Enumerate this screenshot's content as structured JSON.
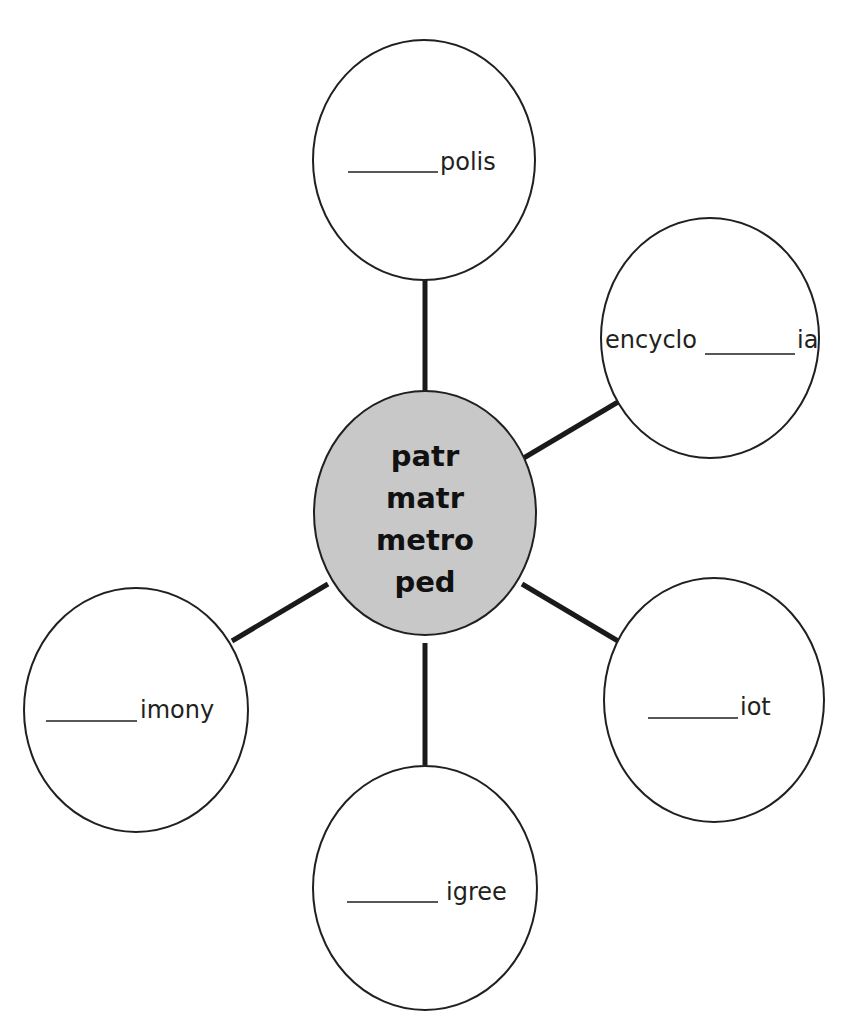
{
  "diagram": {
    "type": "word web",
    "header_fragment_visible": true,
    "colors": {
      "outline": "#231f20",
      "connector": "#1a1a1a",
      "center_fill": "#c8c8c8",
      "leaf_fill": "#ffffff",
      "text": "#231f20"
    },
    "center": {
      "lines": [
        "patr",
        "matr",
        "metro",
        "ped"
      ]
    },
    "nodes": [
      {
        "id": "top",
        "blank": "_______",
        "prefix": "",
        "suffix": "polis",
        "label": "_______polis"
      },
      {
        "id": "upper-right",
        "blank": "_______",
        "prefix": "encyclo",
        "suffix": "ia",
        "label": "encyclo_______ia"
      },
      {
        "id": "lower-right",
        "blank": "_______",
        "prefix": "",
        "suffix": "iot",
        "label": "_______iot"
      },
      {
        "id": "bottom",
        "blank": "_______",
        "prefix": "",
        "suffix": "igree",
        "label": "_______ igree"
      },
      {
        "id": "left",
        "blank": "_______",
        "prefix": "",
        "suffix": "imony",
        "label": "_______imony"
      }
    ]
  }
}
